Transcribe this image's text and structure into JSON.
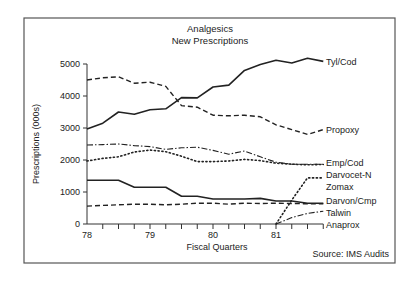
{
  "chart_data": {
    "type": "line",
    "title": "Analgesics",
    "subtitle": "New Prescriptions",
    "xlabel": "Fiscal Quarters",
    "ylabel": "Prescriptions (000s)",
    "source": "Source: IMS Audits",
    "ylim": [
      0,
      5000
    ],
    "yticks": [
      0,
      1000,
      2000,
      3000,
      4000,
      5000
    ],
    "ytick_labels": [
      "0",
      "1000",
      "2000",
      "3000",
      "4000",
      "5000"
    ],
    "xtick_labels": [
      {
        "label": "78",
        "index": 0
      },
      {
        "label": "79",
        "index": 4
      },
      {
        "label": "80",
        "index": 8
      },
      {
        "label": "81",
        "index": 12
      }
    ],
    "x": [
      "78Q1",
      "78Q2",
      "78Q3",
      "78Q4",
      "79Q1",
      "79Q2",
      "79Q3",
      "79Q4",
      "80Q1",
      "80Q2",
      "80Q3",
      "80Q4",
      "81Q1",
      "81Q2",
      "81Q3",
      "81Q4"
    ],
    "grid": false,
    "legend_position": "right, inline labels at line ends",
    "series": [
      {
        "name": "Tyl/Cod",
        "style": "solid",
        "values": [
          2970,
          3150,
          3500,
          3430,
          3570,
          3600,
          3950,
          3940,
          4280,
          4340,
          4800,
          4980,
          5120,
          5030,
          5180,
          5080
        ]
      },
      {
        "name": "Propoxy",
        "style": "dashed",
        "values": [
          4500,
          4570,
          4600,
          4400,
          4430,
          4300,
          3700,
          3650,
          3400,
          3380,
          3400,
          3350,
          3100,
          2950,
          2800,
          2950
        ]
      },
      {
        "name": "Emp/Cod",
        "style": "dashdot",
        "values": [
          2470,
          2480,
          2500,
          2450,
          2420,
          2330,
          2380,
          2400,
          2300,
          2180,
          2280,
          2100,
          1930,
          1870,
          1870,
          1870
        ]
      },
      {
        "name": "Darvocet-N",
        "style": "dotted",
        "values": [
          1970,
          2050,
          2100,
          2250,
          2310,
          2260,
          2120,
          1950,
          1950,
          1970,
          2020,
          1980,
          1900,
          1870,
          1850,
          1860
        ]
      },
      {
        "name": "Zomax",
        "style": "dotted",
        "values": [
          null,
          null,
          null,
          null,
          null,
          null,
          null,
          null,
          null,
          null,
          null,
          null,
          0,
          750,
          1440,
          1440
        ]
      },
      {
        "name": "Darvon/Cmp",
        "style": "solid",
        "values": [
          1370,
          1370,
          1370,
          1150,
          1150,
          1150,
          870,
          870,
          780,
          780,
          780,
          800,
          720,
          720,
          650,
          650
        ]
      },
      {
        "name": "Talwin",
        "style": "dashed",
        "values": [
          560,
          580,
          600,
          620,
          620,
          600,
          620,
          650,
          650,
          620,
          650,
          640,
          650,
          640,
          630,
          630
        ]
      },
      {
        "name": "Anaprox",
        "style": "dashdot",
        "values": [
          null,
          null,
          null,
          null,
          null,
          null,
          null,
          null,
          null,
          null,
          null,
          null,
          0,
          200,
          330,
          400
        ]
      }
    ]
  }
}
